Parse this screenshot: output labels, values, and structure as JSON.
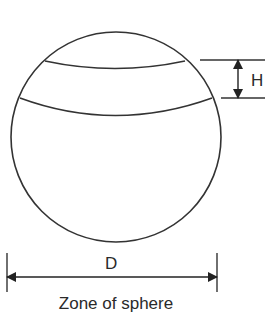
{
  "diagram": {
    "caption": "Zone of sphere",
    "labels": {
      "height": "H",
      "diameter": "D"
    },
    "colors": {
      "stroke": "#333333",
      "background": "#ffffff"
    }
  }
}
